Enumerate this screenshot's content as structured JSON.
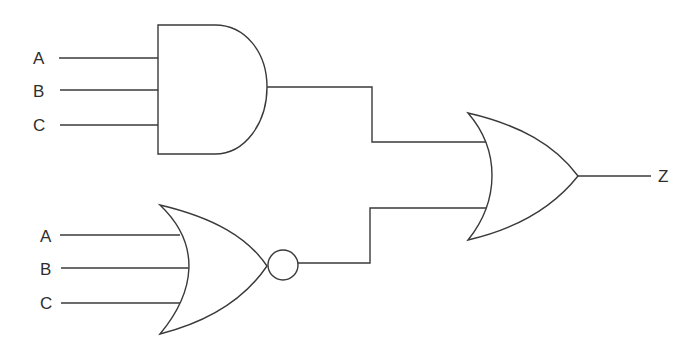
{
  "diagram": {
    "type": "logic-circuit",
    "inputs_group_1": {
      "gate": "AND",
      "labels": [
        "A",
        "B",
        "C"
      ]
    },
    "inputs_group_2": {
      "gate": "NOR",
      "labels": [
        "A",
        "B",
        "C"
      ]
    },
    "final_gate": "OR",
    "output_label": "Z",
    "connections": [
      {
        "from": "AND(A,B,C)",
        "to": "OR.input1"
      },
      {
        "from": "NOR(A,B,C)",
        "to": "OR.input2"
      },
      {
        "from": "OR",
        "to": "Z"
      }
    ],
    "colors": {
      "stroke": "#3a3a3a",
      "background": "#ffffff"
    }
  }
}
